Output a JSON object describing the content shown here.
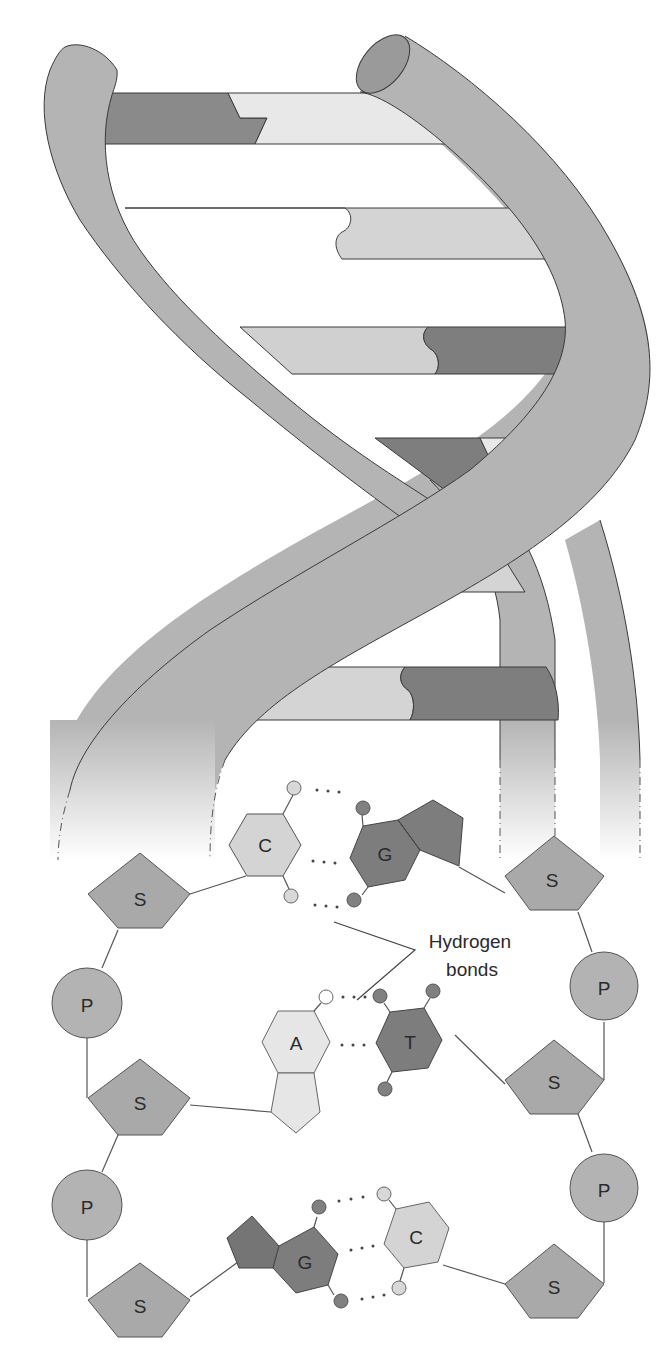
{
  "diagram": {
    "colors": {
      "background": "#ffffff",
      "strand": "#b4b4b4",
      "strand_outline": "#3a3a3a",
      "strand_end": "#9a9a9a",
      "base_dark": "#7d7d7d",
      "base_light": "#e0e0e0",
      "base_mid": "#cdcdcd",
      "sugar": "#a9a9a9",
      "phosphate": "#b3b3b3",
      "atom_dark": "#808080",
      "atom_light": "#d8d8d8",
      "atom_white": "#ffffff"
    },
    "helix": {
      "rungs": [
        {
          "index": 1,
          "left": "dark",
          "right": "light"
        },
        {
          "index": 2,
          "left": "dark",
          "right": "light"
        },
        {
          "index": 3,
          "left": "light",
          "right": "dark"
        },
        {
          "index": 4,
          "left": "dark",
          "right": "light"
        },
        {
          "index": 5,
          "left": "light",
          "right": "light"
        },
        {
          "index": 6,
          "left": "light",
          "right": "dark"
        }
      ]
    },
    "left_backbone": [
      {
        "type": "sugar",
        "label": "S"
      },
      {
        "type": "phosphate",
        "label": "P"
      },
      {
        "type": "sugar",
        "label": "S"
      },
      {
        "type": "phosphate",
        "label": "P"
      },
      {
        "type": "sugar",
        "label": "S"
      }
    ],
    "right_backbone": [
      {
        "type": "sugar",
        "label": "S"
      },
      {
        "type": "phosphate",
        "label": "P"
      },
      {
        "type": "sugar",
        "label": "S"
      },
      {
        "type": "phosphate",
        "label": "P"
      },
      {
        "type": "sugar",
        "label": "S"
      }
    ],
    "base_pairs": [
      {
        "left": "C",
        "right": "G",
        "hydrogen_bonds": 3
      },
      {
        "left": "A",
        "right": "T",
        "hydrogen_bonds": 2
      },
      {
        "left": "G",
        "right": "C",
        "hydrogen_bonds": 3
      }
    ],
    "callout": {
      "line1": "Hydrogen",
      "line2": "bonds"
    }
  }
}
